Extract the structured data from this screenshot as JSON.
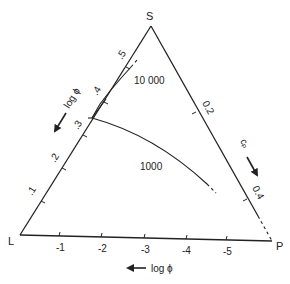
{
  "diagram": {
    "vertices": {
      "top": "S",
      "left": "L",
      "right": "P"
    },
    "bottom_axis": {
      "ticks": [
        "-1",
        "-2",
        "-3",
        "-4",
        "-5"
      ],
      "arrow_label": "log ϕ"
    },
    "left_axis": {
      "ticks": [
        ".1",
        ".2",
        ".3",
        ".4",
        ".5"
      ],
      "arrow_label": "log ϕ"
    },
    "right_axis": {
      "ticks": [
        "0.2",
        "0.4"
      ],
      "arrow_label": "cₚ"
    },
    "curves": [
      {
        "label": "10 000"
      },
      {
        "label": "1000"
      }
    ]
  },
  "colors": {
    "ink": "#222222",
    "background": "#ffffff"
  }
}
